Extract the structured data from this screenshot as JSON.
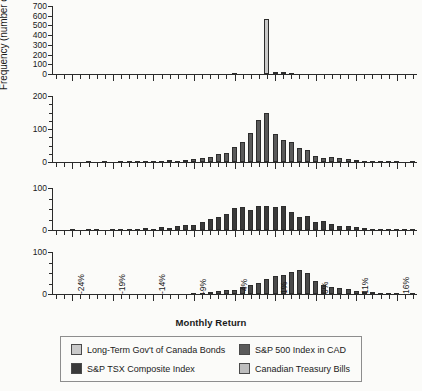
{
  "figure": {
    "ylabel": "Frequency (number of months)",
    "xlabel": "Monthly Return",
    "xtick_labels": [
      "-24%",
      "-19%",
      "-14%",
      "-9%",
      "-4%",
      "1%",
      "6%",
      "11%",
      "16%"
    ],
    "xlim": [
      -26.5,
      18.5
    ],
    "bin_width": 1
  },
  "legend": {
    "items": [
      {
        "label": "Long-Term Gov't of Canada Bonds",
        "color": "#c9c9c9"
      },
      {
        "label": "S&P 500 Index in CAD",
        "color": "#5a5a5a"
      },
      {
        "label": "S&P TSX Composite Index",
        "color": "#3a3a3a"
      },
      {
        "label": "Canadian Treasury Bills",
        "color": "#bdbdbd"
      }
    ]
  },
  "chart_data": [
    {
      "type": "bar",
      "title": "Long-Term Gov't of Canada Bonds",
      "xlabel": "Monthly Return",
      "ylabel": "Frequency (number of months)",
      "ylim": [
        0,
        700
      ],
      "yticks": [
        0,
        100,
        200,
        300,
        400,
        500,
        600,
        700
      ],
      "ytick_labels": [
        "0",
        "100",
        "200",
        "300",
        "400",
        "500",
        "600",
        "700"
      ],
      "color": "#c9c9c9",
      "grid": false,
      "categories": [
        -26,
        -25,
        -24,
        -23,
        -22,
        -21,
        -20,
        -19,
        -18,
        -17,
        -16,
        -15,
        -14,
        -13,
        -12,
        -11,
        -10,
        -9,
        -8,
        -7,
        -6,
        -5,
        -4,
        -3,
        -2,
        -1,
        0,
        1,
        2,
        3,
        4,
        5,
        6,
        7,
        8,
        9,
        10,
        11,
        12,
        13,
        14,
        15,
        16,
        17,
        18
      ],
      "values": [
        0,
        0,
        0,
        0,
        0,
        0,
        0,
        0,
        0,
        0,
        0,
        0,
        0,
        0,
        0,
        0,
        0,
        0,
        0,
        0,
        0,
        0,
        4,
        0,
        0,
        0,
        570,
        16,
        22,
        3,
        0,
        0,
        0,
        0,
        0,
        0,
        0,
        0,
        0,
        0,
        0,
        0,
        0,
        0,
        0
      ]
    },
    {
      "type": "bar",
      "title": "S&P 500 Index in CAD",
      "xlabel": "Monthly Return",
      "ylabel": "Frequency (number of months)",
      "ylim": [
        0,
        200
      ],
      "yticks": [
        0,
        100,
        200
      ],
      "ytick_labels": [
        "0",
        "100",
        "200"
      ],
      "color": "#5a5a5a",
      "grid": false,
      "categories": [
        -26,
        -25,
        -24,
        -23,
        -22,
        -21,
        -20,
        -19,
        -18,
        -17,
        -16,
        -15,
        -14,
        -13,
        -12,
        -11,
        -10,
        -9,
        -8,
        -7,
        -6,
        -5,
        -4,
        -3,
        -2,
        -1,
        0,
        1,
        2,
        3,
        4,
        5,
        6,
        7,
        8,
        9,
        10,
        11,
        12,
        13,
        14,
        15,
        16,
        17,
        18
      ],
      "values": [
        0,
        0,
        0,
        0,
        1,
        0,
        1,
        0,
        2,
        1,
        2,
        2,
        3,
        4,
        5,
        4,
        7,
        8,
        12,
        16,
        24,
        28,
        46,
        62,
        88,
        126,
        147,
        84,
        66,
        62,
        43,
        36,
        17,
        13,
        14,
        13,
        8,
        5,
        3,
        2,
        1,
        2,
        1,
        0,
        1
      ]
    },
    {
      "type": "bar",
      "title": "S&P TSX Composite Index",
      "xlabel": "Monthly Return",
      "ylabel": "Frequency (number of months)",
      "ylim": [
        0,
        100
      ],
      "yticks": [
        0,
        100
      ],
      "ytick_labels": [
        "0",
        "100"
      ],
      "color": "#3a3a3a",
      "grid": false,
      "categories": [
        -26,
        -25,
        -24,
        -23,
        -22,
        -21,
        -20,
        -19,
        -18,
        -17,
        -16,
        -15,
        -14,
        -13,
        -12,
        -11,
        -10,
        -9,
        -8,
        -7,
        -6,
        -5,
        -4,
        -3,
        -2,
        -1,
        0,
        1,
        2,
        3,
        4,
        5,
        6,
        7,
        8,
        9,
        10,
        11,
        12,
        13,
        14,
        15,
        16,
        17,
        18
      ],
      "values": [
        0,
        0,
        1,
        0,
        1,
        1,
        0,
        2,
        2,
        1,
        3,
        4,
        3,
        6,
        5,
        9,
        11,
        13,
        18,
        26,
        30,
        38,
        52,
        55,
        48,
        58,
        56,
        55,
        56,
        43,
        31,
        33,
        18,
        21,
        14,
        10,
        9,
        6,
        5,
        3,
        2,
        3,
        1,
        1,
        2
      ]
    },
    {
      "type": "bar",
      "title": "Canadian Treasury Bills",
      "xlabel": "Monthly Return",
      "ylabel": "Frequency (number of months)",
      "ylim": [
        0,
        100
      ],
      "yticks": [
        0,
        100
      ],
      "ytick_labels": [
        "0",
        "100"
      ],
      "color": "#4a4a4a",
      "grid": false,
      "categories": [
        -26,
        -25,
        -24,
        -23,
        -22,
        -21,
        -20,
        -19,
        -18,
        -17,
        -16,
        -15,
        -14,
        -13,
        -12,
        -11,
        -10,
        -9,
        -8,
        -7,
        -6,
        -5,
        -4,
        -3,
        -2,
        -1,
        0,
        1,
        2,
        3,
        4,
        5,
        6,
        7,
        8,
        9,
        10,
        11,
        12,
        13,
        14,
        15,
        16,
        17,
        18
      ],
      "values": [
        0,
        0,
        0,
        0,
        0,
        0,
        0,
        0,
        0,
        0,
        0,
        0,
        0,
        0,
        0,
        0,
        0,
        1,
        2,
        4,
        6,
        9,
        10,
        16,
        21,
        27,
        36,
        42,
        45,
        52,
        58,
        50,
        30,
        21,
        16,
        15,
        11,
        7,
        5,
        4,
        2,
        1,
        1,
        0,
        1
      ]
    }
  ]
}
